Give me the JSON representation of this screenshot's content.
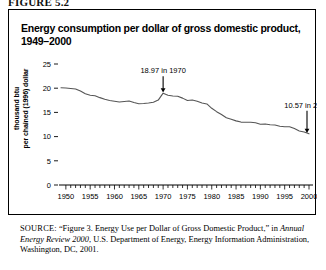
{
  "figure": {
    "label": "FIGURE 5.2"
  },
  "title": {
    "line1": "Energy consumption per dollar of gross domestic product,",
    "line2": "1949–2000"
  },
  "axis": {
    "y_title_line1": "thousand btu",
    "y_title_line2": "per chained (1996) dollar"
  },
  "source": {
    "label": "SOURCE:",
    "text_part1": " “Figure 3. Energy Use per Dollar of Gross Domestic Product,” in ",
    "italic": "Annual Energy Review 2000",
    "text_part2": ", U.S. Department of Energy, Energy Information Administration, Washington, DC, 2001."
  },
  "chart_data": {
    "type": "line",
    "title": "Energy consumption per dollar of gross domestic product, 1949–2000",
    "xlabel": "",
    "ylabel": "thousand btu per chained (1996) dollar",
    "xlim": [
      1949,
      2000
    ],
    "ylim": [
      0,
      25
    ],
    "yticks": [
      0,
      5,
      10,
      15,
      20,
      25
    ],
    "xticks": [
      1950,
      1955,
      1960,
      1965,
      1970,
      1975,
      1980,
      1985,
      1990,
      1995,
      2000
    ],
    "grid": false,
    "legend": "none",
    "line_color": "#555555",
    "annotations": [
      {
        "text": "18.97 in 1970",
        "x": 1970,
        "y": 18.97
      },
      {
        "text": "10.57 in 2000",
        "x": 2000,
        "y": 10.57
      }
    ],
    "x": [
      1949,
      1950,
      1951,
      1952,
      1953,
      1954,
      1955,
      1956,
      1957,
      1958,
      1959,
      1960,
      1961,
      1962,
      1963,
      1964,
      1965,
      1966,
      1967,
      1968,
      1969,
      1970,
      1971,
      1972,
      1973,
      1974,
      1975,
      1976,
      1977,
      1978,
      1979,
      1980,
      1981,
      1982,
      1983,
      1984,
      1985,
      1986,
      1987,
      1988,
      1989,
      1990,
      1991,
      1992,
      1993,
      1994,
      1995,
      1996,
      1997,
      1998,
      1999,
      2000
    ],
    "values": [
      20.1,
      20.05,
      19.95,
      19.85,
      19.4,
      18.85,
      18.55,
      18.45,
      18.05,
      17.7,
      17.45,
      17.3,
      17.15,
      17.25,
      17.35,
      17.05,
      16.8,
      16.85,
      16.95,
      17.1,
      17.55,
      18.97,
      18.55,
      18.4,
      18.35,
      17.95,
      17.45,
      17.55,
      17.3,
      16.95,
      16.75,
      15.85,
      15.15,
      14.55,
      13.9,
      13.6,
      13.25,
      13.0,
      12.95,
      12.95,
      12.85,
      12.55,
      12.6,
      12.45,
      12.4,
      12.15,
      12.05,
      12.05,
      11.65,
      11.15,
      10.95,
      10.57
    ]
  }
}
